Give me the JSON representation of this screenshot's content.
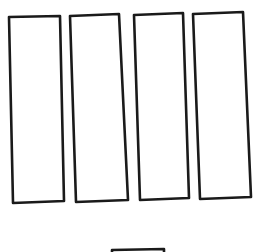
{
  "diagram": {
    "stroke_color": "#1a1a1a",
    "background_color": "#ffffff",
    "rectangles": [
      {
        "id": "rect-1",
        "points": [
          [
            9,
            17
          ],
          [
            60,
            16
          ],
          [
            64,
            201
          ],
          [
            13,
            203
          ]
        ]
      },
      {
        "id": "rect-2",
        "points": [
          [
            70,
            16
          ],
          [
            119,
            14
          ],
          [
            128,
            200
          ],
          [
            76,
            202
          ]
        ]
      },
      {
        "id": "rect-3",
        "points": [
          [
            134,
            15
          ],
          [
            183,
            13
          ],
          [
            189,
            198
          ],
          [
            140,
            200
          ]
        ]
      },
      {
        "id": "rect-4",
        "points": [
          [
            193,
            14
          ],
          [
            243,
            12
          ],
          [
            251,
            197
          ],
          [
            200,
            199
          ]
        ]
      }
    ],
    "partial_shape": {
      "id": "bottom-shape",
      "points": [
        [
          112,
          252
        ],
        [
          112,
          250
        ],
        [
          164,
          249
        ],
        [
          164,
          252
        ]
      ]
    }
  }
}
